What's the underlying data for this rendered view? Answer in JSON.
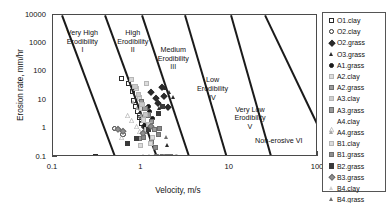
{
  "chart_data": {
    "type": "scatter",
    "title": "",
    "xlabel": "Velocity, m/s",
    "ylabel": "Erosion rate, mm/hr",
    "xscale": "log",
    "yscale": "log",
    "xlim": [
      0.1,
      100
    ],
    "ylim": [
      0.1,
      10000
    ],
    "xticks": [
      "0.1",
      "1",
      "10",
      "100"
    ],
    "yticks": [
      "0.1",
      "1",
      "10",
      "100",
      "1000",
      "10000"
    ],
    "grid": false,
    "legend_position": "right-outside",
    "zones": [
      {
        "name": "Very High Erodibility",
        "numeral": "I",
        "line1": "Very High",
        "line2": "Erodibility",
        "line3": "I"
      },
      {
        "name": "High Erodibility",
        "numeral": "II",
        "line1": "High",
        "line2": "Erodibility",
        "line3": "II"
      },
      {
        "name": "Medium Erodibility",
        "numeral": "III",
        "line1": "Medium",
        "line2": "Erodibility",
        "line3": "III"
      },
      {
        "name": "Low Erodibility",
        "numeral": "IV",
        "line1": "Low",
        "line2": "Erodibility",
        "line3": "IV"
      },
      {
        "name": "Very Low Erodibility",
        "numeral": "V",
        "line1": "Very Low",
        "line2": "Erodibility",
        "line3": "V"
      },
      {
        "name": "Non-erosive",
        "numeral": "VI",
        "line1": "Non-erosive VI",
        "line2": "",
        "line3": ""
      }
    ],
    "series": [
      {
        "name": "O1.clay",
        "marker": "square",
        "fill": "open",
        "color": "#2b2b2b",
        "points": [
          [
            0.3,
            0.1
          ],
          [
            0.6,
            60
          ],
          [
            0.72,
            40
          ],
          [
            0.8,
            20
          ],
          [
            0.82,
            10
          ],
          [
            0.86,
            6
          ],
          [
            0.9,
            4
          ],
          [
            0.95,
            2.5
          ],
          [
            1.0,
            1.5
          ]
        ]
      },
      {
        "name": "O2.clay",
        "marker": "circle",
        "fill": "open",
        "color": "#2b2b2b",
        "points": [
          [
            0.5,
            1.0
          ],
          [
            0.95,
            3
          ],
          [
            1.0,
            2
          ],
          [
            1.05,
            1.2
          ],
          [
            1.1,
            0.8
          ],
          [
            0.62,
            0.6
          ]
        ]
      },
      {
        "name": "O2.grass",
        "marker": "diamond",
        "fill": "solid",
        "color": "#2b2b2b",
        "points": [
          [
            1.3,
            20
          ],
          [
            1.45,
            12
          ],
          [
            1.55,
            8
          ],
          [
            1.7,
            30
          ],
          [
            1.8,
            14
          ],
          [
            2.0,
            6
          ]
        ]
      },
      {
        "name": "O3.grass",
        "marker": "triangle",
        "fill": "solid",
        "color": "#2b2b2b",
        "points": [
          [
            1.9,
            25
          ],
          [
            2.1,
            18
          ],
          [
            2.3,
            12
          ],
          [
            1.6,
            5
          ],
          [
            2.5,
            0.1
          ],
          [
            2.0,
            0.25
          ]
        ]
      },
      {
        "name": "A1.grass",
        "marker": "circle",
        "fill": "solid",
        "color": "#1a1a1a",
        "points": [
          [
            1.2,
            6
          ],
          [
            1.25,
            4
          ],
          [
            1.35,
            2.2
          ],
          [
            1.1,
            1.2
          ]
        ]
      },
      {
        "name": "A2.clay",
        "marker": "square",
        "fill": "light",
        "color": "#d8d8d8",
        "points": [
          [
            0.78,
            55
          ],
          [
            0.88,
            25
          ],
          [
            0.95,
            12
          ],
          [
            1.0,
            5
          ],
          [
            1.05,
            2
          ],
          [
            1.15,
            0.9
          ]
        ]
      },
      {
        "name": "A2.grass",
        "marker": "square",
        "fill": "mid",
        "color": "#9a9a9a",
        "points": [
          [
            1.0,
            9
          ],
          [
            1.1,
            5
          ],
          [
            1.2,
            3
          ],
          [
            1.3,
            1.8
          ],
          [
            0.95,
            0.45
          ],
          [
            1.4,
            0.9
          ]
        ]
      },
      {
        "name": "A3.clay",
        "marker": "square",
        "fill": "light",
        "color": "#c9c9c9",
        "points": [
          [
            0.85,
            30
          ],
          [
            0.92,
            16
          ],
          [
            1.02,
            7
          ],
          [
            1.12,
            3.2
          ],
          [
            1.22,
            1.4
          ]
        ]
      },
      {
        "name": "A3.grass",
        "marker": "square",
        "fill": "mid",
        "color": "#8a8a8a",
        "points": [
          [
            1.3,
            0.35
          ],
          [
            1.45,
            0.22
          ],
          [
            1.55,
            0.6
          ],
          [
            1.05,
            0.5
          ],
          [
            1.6,
            1.0
          ]
        ]
      },
      {
        "name": "A4.clay",
        "marker": "triangle",
        "fill": "open",
        "color": "#9a9a9a",
        "points": [
          [
            0.7,
            6
          ],
          [
            0.78,
            4
          ],
          [
            0.88,
            2.4
          ],
          [
            0.6,
            1.0
          ],
          [
            0.95,
            1.6
          ]
        ]
      },
      {
        "name": "A4.grass",
        "marker": "triangle",
        "fill": "mid",
        "color": "#a5a5a5",
        "points": [
          [
            0.82,
            8
          ],
          [
            0.9,
            5
          ],
          [
            1.0,
            2.8
          ],
          [
            1.48,
            0.1
          ],
          [
            1.65,
            0.1
          ]
        ]
      },
      {
        "name": "B1.clay",
        "marker": "square",
        "fill": "light",
        "color": "#dcdcdc",
        "points": [
          [
            1.15,
            40
          ],
          [
            1.28,
            0.3
          ],
          [
            0.98,
            0.25
          ],
          [
            1.35,
            0.5
          ]
        ]
      },
      {
        "name": "B1.grass",
        "marker": "square",
        "fill": "mid",
        "color": "#8f8f8f",
        "points": [
          [
            1.5,
            0.1
          ],
          [
            1.75,
            0.1
          ],
          [
            1.95,
            0.1
          ],
          [
            2.15,
            0.1
          ]
        ]
      },
      {
        "name": "B2.grass",
        "marker": "square",
        "fill": "solid",
        "color": "#3a3a3a",
        "points": [
          [
            0.88,
            0.45
          ],
          [
            1.2,
            0.9
          ],
          [
            1.55,
            3.5
          ],
          [
            1.75,
            6
          ],
          [
            0.7,
            0.3
          ]
        ]
      },
      {
        "name": "B3.grass",
        "marker": "diamond",
        "fill": "mid",
        "color": "#8f8f8f",
        "points": [
          [
            0.55,
            1.0
          ],
          [
            0.62,
            0.8
          ],
          [
            1.3,
            1.2
          ],
          [
            1.05,
            0.7
          ]
        ]
      },
      {
        "name": "B4.clay",
        "marker": "triangle",
        "fill": "light",
        "color": "#cfcfcf",
        "points": [
          [
            1.4,
            0.1
          ],
          [
            1.6,
            0.1
          ],
          [
            1.85,
            0.1
          ],
          [
            2.35,
            0.1
          ]
        ]
      },
      {
        "name": "B4.grass",
        "marker": "triangle",
        "fill": "mid",
        "color": "#6f6f6f",
        "points": [
          [
            1.25,
            0.1
          ],
          [
            1.05,
            0.1
          ],
          [
            2.05,
            0.1
          ],
          [
            2.6,
            0.1
          ],
          [
            1.95,
            0.5
          ]
        ]
      }
    ]
  },
  "legend": {
    "items": [
      {
        "label": "O1.clay",
        "marker": "square",
        "fill": "open",
        "color": "#2b2b2b"
      },
      {
        "label": "O2.clay",
        "marker": "circle",
        "fill": "open",
        "color": "#2b2b2b"
      },
      {
        "label": "O2.grass",
        "marker": "diamond",
        "fill": "solid",
        "color": "#2b2b2b"
      },
      {
        "label": "O3.grass",
        "marker": "triangle",
        "fill": "solid",
        "color": "#2b2b2b"
      },
      {
        "label": "A1.grass",
        "marker": "circle",
        "fill": "solid",
        "color": "#1a1a1a"
      },
      {
        "label": "A2.clay",
        "marker": "square",
        "fill": "light",
        "color": "#dcdcdc"
      },
      {
        "label": "A2.grass",
        "marker": "square",
        "fill": "mid",
        "color": "#9a9a9a"
      },
      {
        "label": "A3.clay",
        "marker": "square",
        "fill": "light",
        "color": "#cfcfcf"
      },
      {
        "label": "A3.grass",
        "marker": "square",
        "fill": "mid",
        "color": "#9a9a9a"
      },
      {
        "label": "A4.clay",
        "marker": "triangle",
        "fill": "open",
        "color": "#9a9a9a"
      },
      {
        "label": "A4.grass",
        "marker": "triangle",
        "fill": "mid",
        "color": "#a5a5a5"
      },
      {
        "label": "B1.clay",
        "marker": "square",
        "fill": "light",
        "color": "#dcdcdc"
      },
      {
        "label": "B1.grass",
        "marker": "square",
        "fill": "mid",
        "color": "#8f8f8f"
      },
      {
        "label": "B2.grass",
        "marker": "square",
        "fill": "solid",
        "color": "#3a3a3a"
      },
      {
        "label": "B3.grass",
        "marker": "diamond",
        "fill": "mid",
        "color": "#8f8f8f"
      },
      {
        "label": "B4.clay",
        "marker": "triangle",
        "fill": "light",
        "color": "#cfcfcf"
      },
      {
        "label": "B4.grass",
        "marker": "triangle",
        "fill": "mid",
        "color": "#6f6f6f"
      }
    ]
  },
  "colors": {
    "frame": "#4a4a4a",
    "boundary_line": "#1a1a1a",
    "text": "#111111",
    "background": "#ffffff"
  }
}
